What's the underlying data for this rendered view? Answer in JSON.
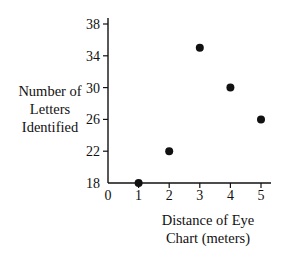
{
  "chart_data": {
    "type": "scatter",
    "title": "",
    "xlabel": "Distance of Eye Chart (meters)",
    "ylabel": "Number of Letters Identified",
    "x": [
      1,
      2,
      3,
      4,
      5
    ],
    "y": [
      18,
      22,
      35,
      30,
      26
    ],
    "xlim": [
      0,
      5
    ],
    "ylim": [
      18,
      38
    ],
    "x_ticks": [
      0,
      1,
      2,
      3,
      4,
      5
    ],
    "y_ticks": [
      18,
      22,
      26,
      30,
      34,
      38
    ],
    "grid": false,
    "legend": null
  },
  "labels": {
    "ylabel_lines": [
      "Number of",
      "Letters",
      "Identified"
    ],
    "xlabel_lines": [
      "Distance of Eye",
      "Chart (meters)"
    ]
  },
  "colors": {
    "ink": "#111111",
    "background": "#ffffff"
  }
}
